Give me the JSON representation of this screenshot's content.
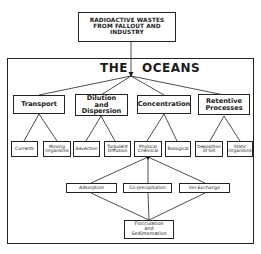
{
  "source": {
    "label": "RADIOACTIVE WASTES\nFROM FALLOUT AND\nINDUSTRY"
  },
  "oceans": {
    "title_left": "THE",
    "title_right": "OCEANS"
  },
  "categories": [
    {
      "label": "Transport",
      "children": [
        "Currents",
        "Moving\nOrganisms"
      ]
    },
    {
      "label": "Dilution\nand\nDispersion",
      "children": [
        "Advection",
        "Turbulent\nDiffusion"
      ]
    },
    {
      "label": "Concentration",
      "children": [
        "Physical\nChemical",
        "Biological"
      ]
    },
    {
      "label": "Retentive\nProcesses",
      "children": [
        "Deposition\nof Silt",
        "Static\nOrganisms"
      ]
    }
  ],
  "processes": [
    "Adsorption",
    "Co-precipitation",
    "Ion-Exchange"
  ],
  "final": {
    "label": "Flocculation\nand\nSedimentation"
  }
}
